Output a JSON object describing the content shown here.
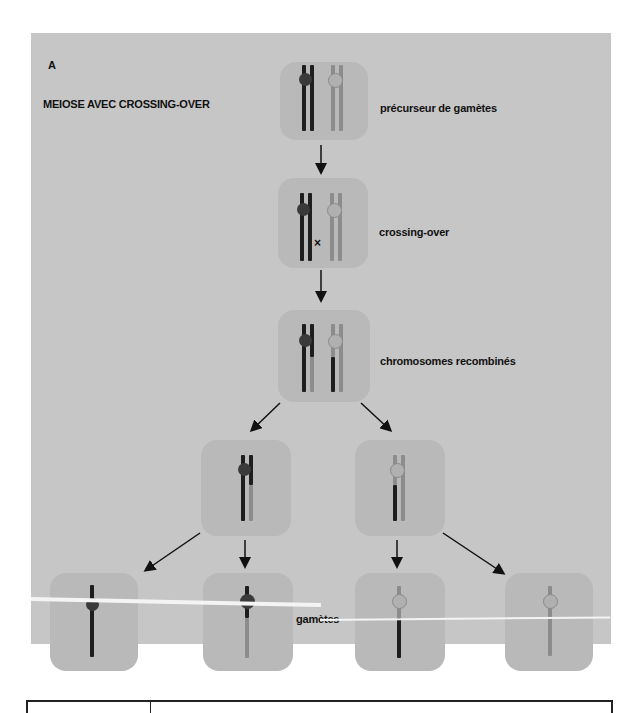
{
  "figure": {
    "panel_letter": "A",
    "title": "MEIOSE AVEC CROSSING-OVER",
    "stages": [
      {
        "label": "précurseur de gamètes"
      },
      {
        "label": "crossing-over",
        "marker": "×"
      },
      {
        "label": "chromosomes recombinés"
      },
      {
        "label": "gamètes"
      }
    ],
    "colors": {
      "background": "#c8c8c8",
      "cell": "#b9b9b9",
      "dark_chromosome": "#1e1e1e",
      "light_chromosome": "#8c8c8c"
    }
  }
}
